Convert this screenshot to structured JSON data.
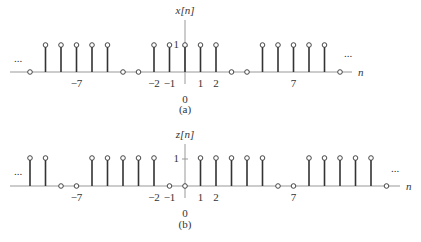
{
  "panels": [
    {
      "id": "a",
      "signal_label": "x[n]",
      "caption": "(a)",
      "axis_label": "n",
      "amplitude_label": "1",
      "ellipsis": "...",
      "tick_labels": [
        {
          "n": -7,
          "text": "−7"
        },
        {
          "n": -2,
          "text": "−2"
        },
        {
          "n": -1,
          "text": "−1"
        },
        {
          "n": 0,
          "text": "0"
        },
        {
          "n": 1,
          "text": "1"
        },
        {
          "n": 2,
          "text": "2"
        },
        {
          "n": 7,
          "text": "7"
        }
      ],
      "n_range": [
        -10,
        10
      ],
      "values": [
        0,
        1,
        1,
        1,
        1,
        1,
        0,
        0,
        1,
        1,
        1,
        1,
        1,
        0,
        0,
        1,
        1,
        1,
        1,
        1,
        0
      ]
    },
    {
      "id": "b",
      "signal_label": "z[n]",
      "caption": "(b)",
      "axis_label": "n",
      "amplitude_label": "1",
      "ellipsis": "...",
      "tick_labels": [
        {
          "n": -7,
          "text": "−7"
        },
        {
          "n": -2,
          "text": "−2"
        },
        {
          "n": -1,
          "text": "−1"
        },
        {
          "n": 0,
          "text": "0"
        },
        {
          "n": 1,
          "text": "1"
        },
        {
          "n": 2,
          "text": "2"
        },
        {
          "n": 7,
          "text": "7"
        }
      ],
      "n_range": [
        -10,
        13
      ],
      "values": [
        1,
        1,
        0,
        0,
        1,
        1,
        1,
        1,
        1,
        0,
        0,
        1,
        1,
        1,
        1,
        1,
        0,
        0,
        1,
        1,
        1,
        1,
        1,
        0
      ]
    }
  ]
}
